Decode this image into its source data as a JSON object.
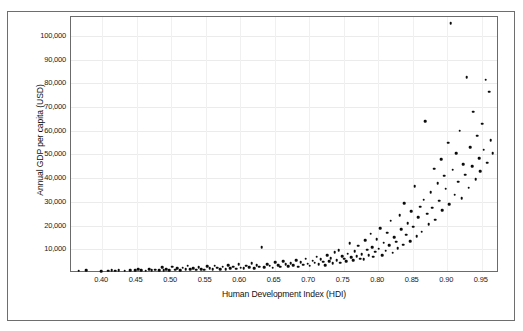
{
  "chart_data": {
    "type": "scatter",
    "title": "",
    "xlabel": "Human Development Index (HDI)",
    "ylabel": "Annual GDP per capita (USD)",
    "xlim": [
      0.355,
      0.975
    ],
    "ylim": [
      0,
      108000
    ],
    "grid": true,
    "legend": false,
    "xticks": [
      "0.40",
      "0.45",
      "0.50",
      "0.55",
      "0.60",
      "0.65",
      "0.70",
      "0.75",
      "0.80",
      "0.85",
      "0.90",
      "0.95"
    ],
    "xtick_values": [
      0.4,
      0.45,
      0.5,
      0.55,
      0.6,
      0.65,
      0.7,
      0.75,
      0.8,
      0.85,
      0.9,
      0.95
    ],
    "yticks": [
      "10,000",
      "20,000",
      "30,000",
      "40,000",
      "50,000",
      "60,000",
      "70,000",
      "80,000",
      "90,000",
      "100,000"
    ],
    "ytick_values": [
      10000,
      20000,
      30000,
      40000,
      50000,
      60000,
      70000,
      80000,
      90000,
      100000
    ],
    "marker": "filled-circle",
    "marker_color": "#0b0b0b",
    "points": [
      [
        0.366,
        900
      ],
      [
        0.377,
        1100
      ],
      [
        0.399,
        800
      ],
      [
        0.409,
        1000
      ],
      [
        0.414,
        1100
      ],
      [
        0.419,
        950
      ],
      [
        0.424,
        1200
      ],
      [
        0.433,
        900
      ],
      [
        0.441,
        1300
      ],
      [
        0.448,
        1100
      ],
      [
        0.452,
        1500
      ],
      [
        0.457,
        1200
      ],
      [
        0.463,
        1000
      ],
      [
        0.468,
        1700
      ],
      [
        0.472,
        1250
      ],
      [
        0.477,
        1400
      ],
      [
        0.483,
        1100
      ],
      [
        0.487,
        2400
      ],
      [
        0.489,
        1300
      ],
      [
        0.493,
        1500
      ],
      [
        0.497,
        1200
      ],
      [
        0.502,
        2600
      ],
      [
        0.506,
        1400
      ],
      [
        0.509,
        1900
      ],
      [
        0.513,
        1300
      ],
      [
        0.517,
        2200
      ],
      [
        0.521,
        1600
      ],
      [
        0.524,
        3000
      ],
      [
        0.528,
        1500
      ],
      [
        0.532,
        2100
      ],
      [
        0.536,
        1350
      ],
      [
        0.54,
        2500
      ],
      [
        0.544,
        1700
      ],
      [
        0.548,
        1450
      ],
      [
        0.552,
        2800
      ],
      [
        0.556,
        1900
      ],
      [
        0.56,
        1550
      ],
      [
        0.563,
        3100
      ],
      [
        0.567,
        2200
      ],
      [
        0.571,
        1700
      ],
      [
        0.575,
        2600
      ],
      [
        0.579,
        1500
      ],
      [
        0.583,
        3400
      ],
      [
        0.586,
        2000
      ],
      [
        0.59,
        2700
      ],
      [
        0.594,
        1800
      ],
      [
        0.598,
        3600
      ],
      [
        0.601,
        2300
      ],
      [
        0.605,
        1900
      ],
      [
        0.609,
        3000
      ],
      [
        0.613,
        2500
      ],
      [
        0.617,
        4200
      ],
      [
        0.62,
        2100
      ],
      [
        0.624,
        3300
      ],
      [
        0.628,
        2700
      ],
      [
        0.631,
        10800
      ],
      [
        0.635,
        2400
      ],
      [
        0.639,
        3800
      ],
      [
        0.643,
        3000
      ],
      [
        0.647,
        2200
      ],
      [
        0.651,
        4500
      ],
      [
        0.655,
        3400
      ],
      [
        0.658,
        2600
      ],
      [
        0.662,
        5000
      ],
      [
        0.666,
        3700
      ],
      [
        0.67,
        2900
      ],
      [
        0.673,
        4100
      ],
      [
        0.677,
        3200
      ],
      [
        0.681,
        5500
      ],
      [
        0.684,
        2700
      ],
      [
        0.688,
        4600
      ],
      [
        0.691,
        3500
      ],
      [
        0.695,
        6000
      ],
      [
        0.698,
        3900
      ],
      [
        0.701,
        3000
      ],
      [
        0.705,
        5200
      ],
      [
        0.708,
        4300
      ],
      [
        0.711,
        6800
      ],
      [
        0.714,
        3600
      ],
      [
        0.717,
        5700
      ],
      [
        0.72,
        4800
      ],
      [
        0.723,
        3300
      ],
      [
        0.726,
        7400
      ],
      [
        0.729,
        5000
      ],
      [
        0.731,
        6200
      ],
      [
        0.734,
        4100
      ],
      [
        0.737,
        8800
      ],
      [
        0.74,
        5500
      ],
      [
        0.743,
        9600
      ],
      [
        0.745,
        4400
      ],
      [
        0.748,
        7000
      ],
      [
        0.751,
        6000
      ],
      [
        0.754,
        5100
      ],
      [
        0.756,
        8200
      ],
      [
        0.759,
        12600
      ],
      [
        0.761,
        6600
      ],
      [
        0.764,
        5400
      ],
      [
        0.766,
        9200
      ],
      [
        0.769,
        7200
      ],
      [
        0.771,
        11500
      ],
      [
        0.774,
        6100
      ],
      [
        0.776,
        8000
      ],
      [
        0.779,
        5700
      ],
      [
        0.781,
        13800
      ],
      [
        0.784,
        9800
      ],
      [
        0.786,
        7600
      ],
      [
        0.789,
        16500
      ],
      [
        0.791,
        11000
      ],
      [
        0.793,
        6800
      ],
      [
        0.796,
        8900
      ],
      [
        0.798,
        14200
      ],
      [
        0.801,
        10200
      ],
      [
        0.803,
        19000
      ],
      [
        0.806,
        7400
      ],
      [
        0.808,
        12800
      ],
      [
        0.811,
        9400
      ],
      [
        0.813,
        17000
      ],
      [
        0.816,
        11800
      ],
      [
        0.818,
        22000
      ],
      [
        0.821,
        8600
      ],
      [
        0.823,
        15000
      ],
      [
        0.826,
        13200
      ],
      [
        0.828,
        10500
      ],
      [
        0.831,
        24500
      ],
      [
        0.833,
        18500
      ],
      [
        0.836,
        12000
      ],
      [
        0.838,
        29500
      ],
      [
        0.841,
        16200
      ],
      [
        0.843,
        21000
      ],
      [
        0.846,
        13500
      ],
      [
        0.848,
        26000
      ],
      [
        0.851,
        19500
      ],
      [
        0.853,
        36500
      ],
      [
        0.856,
        15500
      ],
      [
        0.858,
        23500
      ],
      [
        0.861,
        28000
      ],
      [
        0.863,
        17500
      ],
      [
        0.866,
        31000
      ],
      [
        0.868,
        64000
      ],
      [
        0.871,
        25000
      ],
      [
        0.873,
        20500
      ],
      [
        0.876,
        34000
      ],
      [
        0.878,
        27500
      ],
      [
        0.881,
        44000
      ],
      [
        0.883,
        22500
      ],
      [
        0.886,
        38000
      ],
      [
        0.888,
        30500
      ],
      [
        0.891,
        48000
      ],
      [
        0.893,
        26500
      ],
      [
        0.896,
        41000
      ],
      [
        0.898,
        35500
      ],
      [
        0.901,
        55000
      ],
      [
        0.903,
        29000
      ],
      [
        0.905,
        105500
      ],
      [
        0.908,
        43500
      ],
      [
        0.911,
        33000
      ],
      [
        0.913,
        50500
      ],
      [
        0.916,
        38500
      ],
      [
        0.918,
        60000
      ],
      [
        0.921,
        31500
      ],
      [
        0.923,
        46000
      ],
      [
        0.926,
        41500
      ],
      [
        0.928,
        82500
      ],
      [
        0.931,
        36000
      ],
      [
        0.933,
        53000
      ],
      [
        0.936,
        45000
      ],
      [
        0.938,
        68000
      ],
      [
        0.941,
        39500
      ],
      [
        0.943,
        58000
      ],
      [
        0.946,
        48500
      ],
      [
        0.948,
        43000
      ],
      [
        0.951,
        63000
      ],
      [
        0.953,
        52000
      ],
      [
        0.956,
        81500
      ],
      [
        0.958,
        46500
      ],
      [
        0.961,
        76500
      ],
      [
        0.963,
        56000
      ],
      [
        0.966,
        50500
      ]
    ]
  }
}
